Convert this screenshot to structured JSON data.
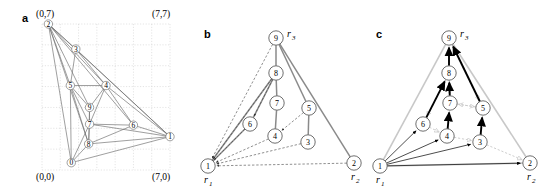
{
  "figure": {
    "panels": [
      {
        "id": "a",
        "label": "a"
      },
      {
        "id": "b",
        "label": "b"
      },
      {
        "id": "c",
        "label": "c"
      }
    ]
  },
  "panel_a": {
    "label": "a",
    "corners": {
      "top_left": "(0,7)",
      "top_right": "(7,7)",
      "bottom_left": "(0,0)",
      "bottom_right": "(7,0)"
    },
    "grid": {
      "x_min": 0,
      "x_max": 7,
      "y_min": 0,
      "y_max": 7,
      "visible": true
    },
    "nodes": [
      {
        "id": "0",
        "label": "0",
        "x": 1.6,
        "y": 0.35
      },
      {
        "id": "1",
        "label": "1",
        "x": 7.0,
        "y": 1.6
      },
      {
        "id": "2",
        "label": "2",
        "x": 0.35,
        "y": 7.0
      },
      {
        "id": "3",
        "label": "3",
        "x": 1.85,
        "y": 5.8
      },
      {
        "id": "4",
        "label": "4",
        "x": 3.5,
        "y": 4.05
      },
      {
        "id": "5",
        "label": "5",
        "x": 1.55,
        "y": 4.05
      },
      {
        "id": "6",
        "label": "6",
        "x": 5.0,
        "y": 2.15
      },
      {
        "id": "7",
        "label": "7",
        "x": 2.6,
        "y": 2.2
      },
      {
        "id": "8",
        "label": "8",
        "x": 2.55,
        "y": 1.25
      },
      {
        "id": "9",
        "label": "9",
        "x": 2.6,
        "y": 3.0
      }
    ],
    "edges": [
      [
        "2",
        "1"
      ],
      [
        "2",
        "0"
      ],
      [
        "2",
        "3"
      ],
      [
        "2",
        "5"
      ],
      [
        "2",
        "8"
      ],
      [
        "2",
        "9"
      ],
      [
        "2",
        "4"
      ],
      [
        "2",
        "6"
      ],
      [
        "0",
        "1"
      ],
      [
        "0",
        "8"
      ],
      [
        "0",
        "7"
      ],
      [
        "0",
        "5"
      ],
      [
        "1",
        "6"
      ],
      [
        "1",
        "8"
      ],
      [
        "1",
        "4"
      ],
      [
        "1",
        "7"
      ],
      [
        "1",
        "3"
      ],
      [
        "3",
        "5"
      ],
      [
        "3",
        "4"
      ],
      [
        "5",
        "4"
      ],
      [
        "5",
        "9"
      ],
      [
        "5",
        "7"
      ],
      [
        "5",
        "8"
      ],
      [
        "4",
        "9"
      ],
      [
        "4",
        "6"
      ],
      [
        "4",
        "7"
      ],
      [
        "7",
        "6"
      ],
      [
        "7",
        "8"
      ],
      [
        "9",
        "7"
      ],
      [
        "9",
        "8"
      ],
      [
        "8",
        "6"
      ]
    ]
  },
  "panel_b": {
    "label": "b",
    "root_labels": {
      "r1": "r",
      "r1_sub": "1",
      "r2": "r",
      "r2_sub": "2",
      "r3": "r",
      "r3_sub": "3"
    },
    "nodes": [
      {
        "id": "1",
        "label": "1",
        "x": 12,
        "y": 166,
        "root": "r1"
      },
      {
        "id": "2",
        "label": "2",
        "x": 158,
        "y": 163,
        "root": "r2"
      },
      {
        "id": "3",
        "label": "3",
        "x": 112,
        "y": 142,
        "root": null
      },
      {
        "id": "4",
        "label": "4",
        "x": 79,
        "y": 136,
        "root": null
      },
      {
        "id": "5",
        "label": "5",
        "x": 113,
        "y": 108,
        "root": null
      },
      {
        "id": "6",
        "label": "6",
        "x": 54,
        "y": 124,
        "root": null
      },
      {
        "id": "7",
        "label": "7",
        "x": 81,
        "y": 103,
        "root": null
      },
      {
        "id": "8",
        "label": "8",
        "x": 80,
        "y": 73,
        "root": null
      },
      {
        "id": "9",
        "label": "9",
        "x": 80,
        "y": 38,
        "root": "r3"
      }
    ],
    "tree_edges": [
      [
        "9",
        "8"
      ],
      [
        "8",
        "7"
      ],
      [
        "7",
        "4"
      ],
      [
        "9",
        "5"
      ],
      [
        "5",
        "3"
      ],
      [
        "8",
        "6"
      ],
      [
        "9",
        "2"
      ],
      [
        "1",
        "6"
      ],
      [
        "1",
        "8"
      ]
    ],
    "dashed_arrows": [
      {
        "from": "9",
        "to": "1"
      },
      {
        "from": "8",
        "to": "1"
      },
      {
        "from": "6",
        "to": "1"
      },
      {
        "from": "4",
        "to": "1"
      },
      {
        "from": "3",
        "to": "1"
      },
      {
        "from": "2",
        "to": "1"
      },
      {
        "from": "8",
        "to": "6"
      },
      {
        "from": "5",
        "to": "4"
      }
    ]
  },
  "panel_c": {
    "label": "c",
    "root_labels": {
      "r1": "r",
      "r1_sub": "1",
      "r2": "r",
      "r2_sub": "2",
      "r3": "r",
      "r3_sub": "3"
    },
    "nodes": [
      {
        "id": "1",
        "label": "1",
        "x": 12,
        "y": 166,
        "root": "r1"
      },
      {
        "id": "2",
        "label": "2",
        "x": 162,
        "y": 163,
        "root": "r2"
      },
      {
        "id": "3",
        "label": "3",
        "x": 112,
        "y": 142,
        "root": null
      },
      {
        "id": "4",
        "label": "4",
        "x": 79,
        "y": 136,
        "root": null
      },
      {
        "id": "5",
        "label": "5",
        "x": 115,
        "y": 108,
        "root": null
      },
      {
        "id": "6",
        "label": "6",
        "x": 55,
        "y": 124,
        "root": null
      },
      {
        "id": "7",
        "label": "7",
        "x": 82,
        "y": 103,
        "root": null
      },
      {
        "id": "8",
        "label": "8",
        "x": 81,
        "y": 73,
        "root": null
      },
      {
        "id": "9",
        "label": "9",
        "x": 81,
        "y": 38,
        "root": "r3"
      }
    ],
    "bold_arrows": [
      {
        "from": "8",
        "to": "9"
      },
      {
        "from": "5",
        "to": "9"
      },
      {
        "from": "6",
        "to": "8"
      },
      {
        "from": "7",
        "to": "8"
      },
      {
        "from": "4",
        "to": "7"
      },
      {
        "from": "3",
        "to": "5"
      },
      {
        "from": "1",
        "to": "6"
      },
      {
        "from": "1",
        "to": "4"
      },
      {
        "from": "1",
        "to": "3"
      },
      {
        "from": "1",
        "to": "2"
      }
    ],
    "gray_arrows": [
      {
        "from": "8",
        "to": "6"
      },
      {
        "from": "7",
        "to": "5"
      },
      {
        "from": "4",
        "to": "3"
      },
      {
        "from": "6",
        "to": "4"
      },
      {
        "from": "5",
        "to": "7"
      },
      {
        "from": "3",
        "to": "2"
      },
      {
        "from": "9",
        "to": "5"
      },
      {
        "from": "8",
        "to": "7"
      }
    ],
    "outline_edges": [
      [
        "1",
        "9"
      ],
      [
        "9",
        "2"
      ],
      [
        "1",
        "2"
      ]
    ]
  },
  "colors": {
    "ink": "#000000",
    "gray_edge": "#8a8a8a",
    "light_gray": "#c8c8c8",
    "grid": "#c9c9c9",
    "node_stroke": "#555555",
    "node_fill": "#ffffff"
  }
}
